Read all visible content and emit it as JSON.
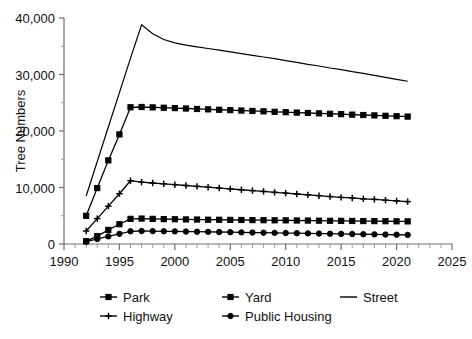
{
  "chart_data": {
    "type": "line",
    "title": "",
    "xlabel": "",
    "ylabel": "Tree Numbers",
    "xlim": [
      1990,
      2025
    ],
    "ylim": [
      0,
      40000
    ],
    "xticks": [
      1990,
      1995,
      2000,
      2005,
      2010,
      2015,
      2020,
      2025
    ],
    "xticklabels": [
      "1990",
      "1995",
      "2000",
      "2005",
      "2010",
      "2015",
      "2020",
      "2025"
    ],
    "yticks": [
      0,
      10000,
      20000,
      30000,
      40000
    ],
    "yticklabels": [
      "0",
      "10,000",
      "20,000",
      "30,000",
      "40,000"
    ],
    "minor_ytick_step": 5000,
    "minor_xtick_step": 1,
    "grid": false,
    "legend_position": "bottom",
    "x": [
      1992,
      1993,
      1994,
      1995,
      1996,
      1997,
      1998,
      1999,
      2000,
      2001,
      2002,
      2003,
      2004,
      2005,
      2006,
      2007,
      2008,
      2009,
      2010,
      2011,
      2012,
      2013,
      2014,
      2015,
      2016,
      2017,
      2018,
      2019,
      2020,
      2021
    ],
    "series": [
      {
        "name": "Park",
        "marker": "square",
        "values": [
          500,
          1400,
          2500,
          3500,
          4450,
          4500,
          4450,
          4400,
          4380,
          4350,
          4330,
          4300,
          4290,
          4270,
          4250,
          4230,
          4210,
          4190,
          4180,
          4160,
          4150,
          4130,
          4110,
          4100,
          4080,
          4060,
          4050,
          4030,
          4010,
          4000
        ]
      },
      {
        "name": "Yard",
        "marker": "square",
        "values": [
          5000,
          9900,
          14800,
          19400,
          24200,
          24250,
          24180,
          24120,
          24050,
          23980,
          23900,
          23830,
          23760,
          23690,
          23620,
          23550,
          23480,
          23400,
          23330,
          23260,
          23190,
          23120,
          23050,
          22980,
          22900,
          22830,
          22760,
          22690,
          22620,
          22550
        ]
      },
      {
        "name": "Street",
        "marker": "none",
        "values": [
          8500,
          14600,
          20700,
          26800,
          32900,
          38800,
          37200,
          36200,
          35600,
          35200,
          34900,
          34600,
          34300,
          34000,
          33700,
          33400,
          33100,
          32800,
          32450,
          32150,
          31800,
          31500,
          31150,
          30850,
          30500,
          30200,
          29850,
          29500,
          29150,
          28800
        ]
      },
      {
        "name": "Highway",
        "marker": "cross",
        "values": [
          2300,
          4500,
          6700,
          8900,
          11200,
          10950,
          10800,
          10650,
          10500,
          10350,
          10200,
          10050,
          9900,
          9750,
          9600,
          9450,
          9300,
          9150,
          9000,
          8850,
          8700,
          8550,
          8400,
          8250,
          8150,
          8000,
          7900,
          7750,
          7620,
          7500
        ]
      },
      {
        "name": "Public Housing",
        "marker": "circle",
        "values": [
          400,
          900,
          1350,
          1800,
          2250,
          2300,
          2280,
          2250,
          2230,
          2200,
          2180,
          2150,
          2120,
          2090,
          2060,
          2030,
          2000,
          1970,
          1940,
          1910,
          1880,
          1850,
          1820,
          1790,
          1760,
          1730,
          1700,
          1670,
          1640,
          1610
        ]
      }
    ]
  },
  "legend": {
    "entries": [
      {
        "label": "Park",
        "marker": "square"
      },
      {
        "label": "Yard",
        "marker": "square"
      },
      {
        "label": "Street",
        "marker": "none"
      },
      {
        "label": "Highway",
        "marker": "cross"
      },
      {
        "label": "Public Housing",
        "marker": "circle"
      }
    ]
  },
  "colors": {
    "line": "#000000",
    "axis": "#6f6f6f",
    "background": "#ffffff",
    "text": "#111111"
  }
}
